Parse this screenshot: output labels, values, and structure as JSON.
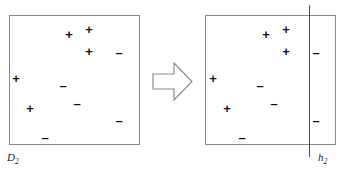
{
  "figure": {
    "background_color": "#ffffff",
    "border_color": "#8a8a8a",
    "marker_color": "#111111",
    "line_color": "#4a4a4a",
    "width": 345,
    "height": 174
  },
  "chart_data": {
    "type": "scatter",
    "title": "",
    "xlabel": "",
    "ylabel": "",
    "grid": false,
    "legend": null,
    "panels": [
      {
        "id": "left",
        "label": "D",
        "label_subscript": "2",
        "label_full": "D2",
        "box": {
          "x": 9,
          "y": 15,
          "width": 131,
          "height": 130
        },
        "hypothesis_line": null,
        "points": [
          {
            "x": 69,
            "y": 34,
            "class": "+"
          },
          {
            "x": 89,
            "y": 29,
            "class": "+"
          },
          {
            "x": 89,
            "y": 51,
            "class": "+"
          },
          {
            "x": 119,
            "y": 52,
            "class": "-"
          },
          {
            "x": 16,
            "y": 78,
            "class": "+"
          },
          {
            "x": 63,
            "y": 85,
            "class": "-"
          },
          {
            "x": 77,
            "y": 103,
            "class": "-"
          },
          {
            "x": 30,
            "y": 108,
            "class": "+"
          },
          {
            "x": 119,
            "y": 120,
            "class": "-"
          },
          {
            "x": 45,
            "y": 137,
            "class": "-"
          }
        ]
      },
      {
        "id": "right",
        "label": "h",
        "label_subscript": "2",
        "label_full": "h2",
        "box": {
          "x": 205,
          "y": 15,
          "width": 131,
          "height": 130
        },
        "hypothesis_line": {
          "x": 309,
          "y_top": 5,
          "y_bottom": 157,
          "orientation": "vertical"
        },
        "points": [
          {
            "x": 266,
            "y": 34,
            "class": "+"
          },
          {
            "x": 286,
            "y": 29,
            "class": "+"
          },
          {
            "x": 286,
            "y": 51,
            "class": "+"
          },
          {
            "x": 316,
            "y": 52,
            "class": "-"
          },
          {
            "x": 213,
            "y": 78,
            "class": "+"
          },
          {
            "x": 260,
            "y": 85,
            "class": "-"
          },
          {
            "x": 274,
            "y": 103,
            "class": "-"
          },
          {
            "x": 227,
            "y": 108,
            "class": "+"
          },
          {
            "x": 316,
            "y": 120,
            "class": "-"
          },
          {
            "x": 242,
            "y": 137,
            "class": "-"
          }
        ]
      }
    ],
    "annotations": [
      {
        "name": "transform-arrow",
        "shape": "block-arrow",
        "direction": "right",
        "x": 152,
        "y": 62,
        "width": 41,
        "height": 39
      }
    ]
  },
  "labels": {
    "left_panel": "D",
    "left_panel_sub": "2",
    "right_panel": "h",
    "right_panel_sub": "2"
  },
  "symbols": {
    "positive": "+",
    "negative": "–"
  }
}
